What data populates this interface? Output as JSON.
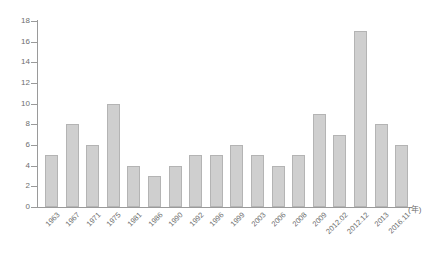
{
  "chart_data": {
    "type": "bar",
    "title": "",
    "subtitle": "",
    "xlabel": "(年)",
    "ylabel": "",
    "ylim": [
      0,
      18
    ],
    "ytick_step": 2,
    "yticks": [
      0,
      2,
      4,
      6,
      8,
      10,
      12,
      14,
      16,
      18
    ],
    "grid": false,
    "legend": null,
    "legend_position": "none",
    "categories": [
      "1963",
      "1967",
      "1971",
      "1975",
      "1981",
      "1986",
      "1990",
      "1992",
      "1996",
      "1999",
      "2003",
      "2006",
      "2008",
      "2009",
      "2012.02",
      "2012.12",
      "2013",
      "2016.11"
    ],
    "values": [
      5,
      8,
      6,
      10,
      4,
      3,
      4,
      5,
      5,
      6,
      5,
      4,
      5,
      9,
      7,
      17,
      8,
      6
    ],
    "annotations": []
  },
  "style": {
    "bar_fill": "#cfcfcf",
    "bar_border": "#b4b4b4",
    "axis_color": "#9a9a9a",
    "text_color": "#6e6e6e",
    "background": "#ffffff"
  }
}
